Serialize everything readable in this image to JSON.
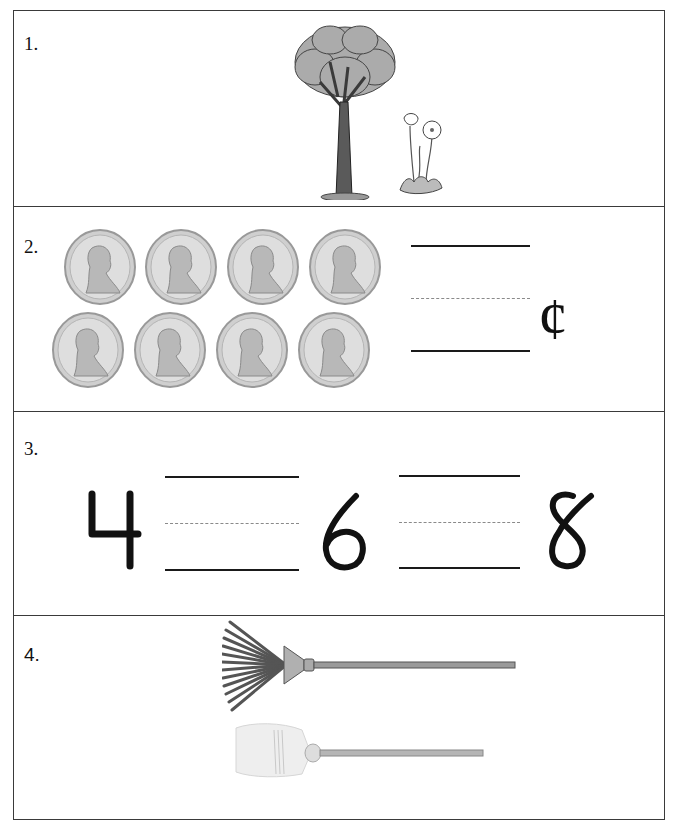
{
  "worksheet": {
    "problems": [
      {
        "number": "1.",
        "images": [
          {
            "name": "tree",
            "description": "tall tree"
          },
          {
            "name": "flower",
            "description": "small flowering plant"
          }
        ]
      },
      {
        "number": "2.",
        "coin_type": "penny",
        "coin_count": 8,
        "rows": [
          4,
          4
        ],
        "answer_blank": "",
        "unit_symbol": "¢"
      },
      {
        "number": "3.",
        "sequence": [
          "4",
          "",
          "6",
          "",
          "8"
        ]
      },
      {
        "number": "4.",
        "images": [
          {
            "name": "rake",
            "description": "leaf rake"
          },
          {
            "name": "broom",
            "description": "broom"
          }
        ]
      }
    ]
  },
  "colors": {
    "border": "#3a3a3a",
    "ink": "#111111",
    "guide_dash": "#8a8a8a",
    "coin": "#c9c9c9",
    "foliage": "#a8a8a8"
  }
}
